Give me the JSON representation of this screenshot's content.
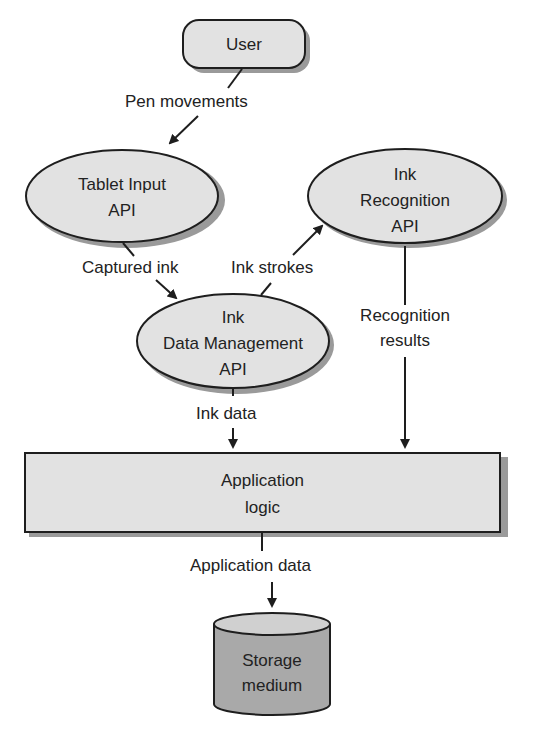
{
  "diagram": {
    "nodes": {
      "user": {
        "label": "User",
        "shape": "rounded-rect"
      },
      "tablet_input": {
        "line1": "Tablet Input",
        "line2": "API",
        "shape": "ellipse"
      },
      "ink_recognition": {
        "line1": "Ink",
        "line2": "Recognition",
        "line3": "API",
        "shape": "ellipse"
      },
      "ink_data_mgmt": {
        "line1": "Ink",
        "line2": "Data Management",
        "line3": "API",
        "shape": "ellipse"
      },
      "app_logic": {
        "line1": "Application",
        "line2": "logic",
        "shape": "rect"
      },
      "storage": {
        "line1": "Storage",
        "line2": "medium",
        "shape": "cylinder"
      }
    },
    "edges": {
      "pen_movements": {
        "label": "Pen movements",
        "from": "User",
        "to": "Tablet Input API"
      },
      "captured_ink": {
        "label": "Captured ink",
        "from": "Tablet Input API",
        "to": "Ink Data Management API"
      },
      "ink_strokes": {
        "label": "Ink strokes",
        "from": "Ink Data Management API",
        "to": "Ink Recognition API"
      },
      "recognition_results": {
        "line1": "Recognition",
        "line2": "results",
        "from": "Ink Recognition API",
        "to": "Application logic"
      },
      "ink_data": {
        "label": "Ink data",
        "from": "Ink Data Management API",
        "to": "Application logic"
      },
      "application_data": {
        "label": "Application data",
        "from": "Application logic",
        "to": "Storage medium"
      }
    },
    "colors": {
      "node_fill": "#e2e2e2",
      "storage_fill": "#a9a9a9",
      "stroke": "#1e1e1e",
      "shadow": "#9a9a9a"
    }
  }
}
